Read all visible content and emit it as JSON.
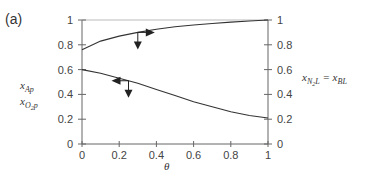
{
  "chart_data": {
    "type": "line",
    "panel_label": "(a)",
    "title": "",
    "xlabel": "θ",
    "ylabel_left": [
      "x_Ap",
      "x_O2p"
    ],
    "ylabel_right": "x_N2L = x_BL",
    "xlim": [
      0,
      1
    ],
    "ylim": [
      0,
      1
    ],
    "x_ticks": [
      "0",
      "0.2",
      "0.4",
      "0.6",
      "0.8",
      "1"
    ],
    "y_ticks_left": [
      "0",
      "0.2",
      "0.4",
      "0.6",
      "0.8",
      "1"
    ],
    "y_ticks_right": [
      "0",
      "0.2",
      "0.4",
      "0.6",
      "0.8",
      "1"
    ],
    "grid": false,
    "series": [
      {
        "name": "x_N2L = x_BL (right axis)",
        "x": [
          0,
          0.1,
          0.2,
          0.3,
          0.4,
          0.5,
          0.6,
          0.7,
          0.8,
          0.9,
          1.0
        ],
        "y": [
          0.76,
          0.83,
          0.87,
          0.9,
          0.925,
          0.945,
          0.96,
          0.972,
          0.983,
          0.992,
          1.0
        ]
      },
      {
        "name": "x_Ap / x_O2p (left axis)",
        "x": [
          0,
          0.1,
          0.2,
          0.3,
          0.4,
          0.5,
          0.6,
          0.7,
          0.8,
          0.9,
          1.0
        ],
        "y": [
          0.6,
          0.57,
          0.53,
          0.49,
          0.44,
          0.39,
          0.34,
          0.3,
          0.26,
          0.23,
          0.21
        ]
      }
    ],
    "annotations": [
      {
        "type": "arrow-pair",
        "at_x": 0.3,
        "on_series": 0,
        "directions": [
          "down",
          "right"
        ],
        "meaning": "curve refers to right axis"
      },
      {
        "type": "arrow-pair",
        "at_x": 0.25,
        "on_series": 1,
        "directions": [
          "down",
          "left"
        ],
        "meaning": "curve refers to left axis"
      }
    ]
  },
  "labels": {
    "panel": "(a)",
    "x_axis": "θ",
    "left_1_main": "x",
    "left_1_sub": "Ap",
    "left_2_main": "x",
    "left_2_sub_a": "O",
    "left_2_sub_b": "2",
    "left_2_sub_c": "p",
    "right_main1": "x",
    "right_sub1a": "N",
    "right_sub1b": "2",
    "right_sub1c": "L",
    "right_eq": " = x",
    "right_sub2": "BL"
  },
  "colors": {
    "axis": "#666666",
    "curve": "#333333",
    "top_line": "#bbbbbb"
  }
}
